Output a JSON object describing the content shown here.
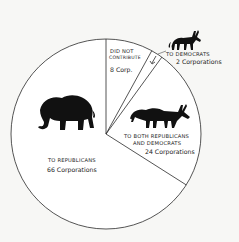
{
  "chart_data": {
    "type": "pie",
    "title": "",
    "unit": "Corporations",
    "start_angle_deg": -90,
    "direction": "clockwise",
    "slices": [
      {
        "key": "did_not_contribute",
        "label": "DID NOT CONTRIBUTE",
        "value": 8,
        "value_label": "8 Corp."
      },
      {
        "key": "democrats",
        "label": "TO DEMOCRATS",
        "value": 2,
        "value_label": "2 Corporations"
      },
      {
        "key": "both",
        "label": "TO BOTH REPUBLICANS AND DEMOCRATS",
        "value": 24,
        "value_label": "24 Corporations"
      },
      {
        "key": "republicans",
        "label": "TO REPUBLICANS",
        "value": 66,
        "value_label": "66 Corporations"
      }
    ],
    "total": 100,
    "icons": [
      {
        "slice": "republicans",
        "icon": "elephant-icon"
      },
      {
        "slice": "both",
        "icon": "elephant-donkey-hybrid-icon"
      },
      {
        "slice": "democrats",
        "icon": "donkey-icon"
      }
    ],
    "legend": "none"
  },
  "labels": {
    "did_not_line1": "DID NOT",
    "did_not_line2": "CONTRIBUTE",
    "did_not_value": "8 Corp.",
    "dem_line1": "TO DEMOCRATS",
    "dem_value": "2 Corporations",
    "both_line1": "TO BOTH REPUBLICANS",
    "both_line2": "AND DEMOCRATS",
    "both_value": "24 Corporations",
    "rep_line1": "TO REPUBLICANS",
    "rep_value": "66 Corporations"
  },
  "colors": {
    "line": "#2a2a2a",
    "fill": "#ffffff",
    "background": "#f7f7f5",
    "icon": "#111111"
  }
}
